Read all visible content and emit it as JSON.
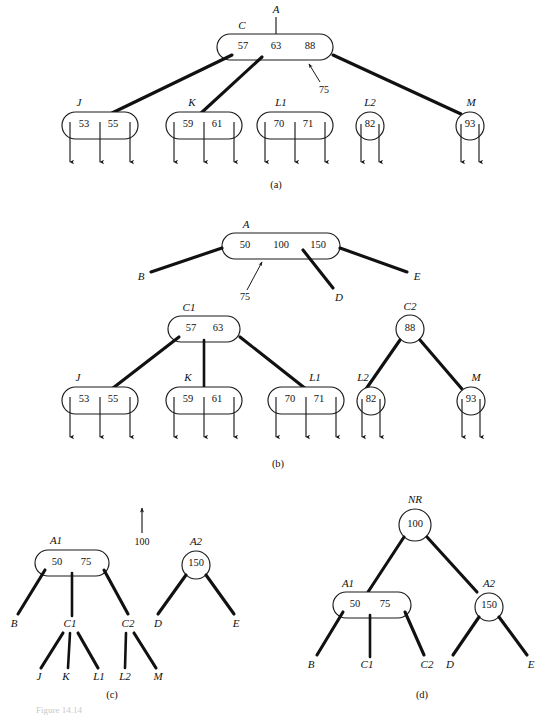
{
  "figure": {
    "caption_partial": "Figure 14.14",
    "width": 557,
    "height": 715,
    "background": "#ffffff",
    "ink_color": "#111111"
  },
  "panels": [
    {
      "id": "a",
      "caption": "(a)",
      "parent_pointer_label": "A",
      "annotation": "75",
      "nodes": [
        {
          "name": "C",
          "label": "C",
          "shape": "rounded",
          "values": [
            "57",
            "63",
            "88"
          ],
          "child_arrows": 0
        },
        {
          "name": "J",
          "label": "J",
          "shape": "rounded",
          "values": [
            "53",
            "55"
          ],
          "child_arrows": 3
        },
        {
          "name": "K",
          "label": "K",
          "shape": "rounded",
          "values": [
            "59",
            "61"
          ],
          "child_arrows": 3
        },
        {
          "name": "L1",
          "label": "L1",
          "shape": "rounded",
          "values": [
            "70",
            "71"
          ],
          "child_arrows": 3
        },
        {
          "name": "L2",
          "label": "L2",
          "shape": "circle",
          "values": [
            "82"
          ],
          "child_arrows": 2
        },
        {
          "name": "M",
          "label": "M",
          "shape": "circle",
          "values": [
            "93"
          ],
          "child_arrows": 2
        }
      ]
    },
    {
      "id": "b",
      "caption": "(b)",
      "annotation": "75",
      "nodes": [
        {
          "name": "A",
          "label": "A",
          "shape": "rounded",
          "values": [
            "50",
            "100",
            "150"
          ],
          "child_arrows": 0
        },
        {
          "name": "B",
          "label": "B",
          "shape": "leaf-label",
          "values": []
        },
        {
          "name": "D",
          "label": "D",
          "shape": "leaf-label",
          "values": []
        },
        {
          "name": "E",
          "label": "E",
          "shape": "leaf-label",
          "values": []
        },
        {
          "name": "C1",
          "label": "C1",
          "shape": "rounded",
          "values": [
            "57",
            "63"
          ],
          "child_arrows": 0
        },
        {
          "name": "C2",
          "label": "C2",
          "shape": "circle",
          "values": [
            "88"
          ],
          "child_arrows": 0
        },
        {
          "name": "J",
          "label": "J",
          "shape": "rounded",
          "values": [
            "53",
            "55"
          ],
          "child_arrows": 3
        },
        {
          "name": "K",
          "label": "K",
          "shape": "rounded",
          "values": [
            "59",
            "61"
          ],
          "child_arrows": 3
        },
        {
          "name": "L1",
          "label": "L1",
          "shape": "rounded",
          "values": [
            "70",
            "71"
          ],
          "child_arrows": 3
        },
        {
          "name": "L2",
          "label": "L2",
          "shape": "circle",
          "values": [
            "82"
          ],
          "child_arrows": 2
        },
        {
          "name": "M",
          "label": "M",
          "shape": "circle",
          "values": [
            "93"
          ],
          "child_arrows": 2
        }
      ]
    },
    {
      "id": "c",
      "caption": "(c)",
      "promoted_key": "100",
      "nodes": [
        {
          "name": "A1",
          "label": "A1",
          "shape": "rounded",
          "values": [
            "50",
            "75"
          ]
        },
        {
          "name": "A2",
          "label": "A2",
          "shape": "circle",
          "values": [
            "150"
          ]
        }
      ],
      "leaf_labels_left": [
        "B",
        "C1",
        "C2"
      ],
      "leaf_labels_c1": [
        "J",
        "K",
        "L1"
      ],
      "leaf_labels_c2": [
        "L2",
        "M"
      ],
      "leaf_labels_right": [
        "D",
        "E"
      ]
    },
    {
      "id": "d",
      "caption": "(d)",
      "nodes": [
        {
          "name": "NR",
          "label": "NR",
          "shape": "circle",
          "values": [
            "100"
          ]
        },
        {
          "name": "A1",
          "label": "A1",
          "shape": "rounded",
          "values": [
            "50",
            "75"
          ]
        },
        {
          "name": "A2",
          "label": "A2",
          "shape": "circle",
          "values": [
            "150"
          ]
        }
      ],
      "leaf_labels_left": [
        "B",
        "C1",
        "C2"
      ],
      "leaf_labels_right": [
        "D",
        "E"
      ]
    }
  ],
  "text": {
    "a_label_A": "A",
    "a_label_C": "C",
    "a_label_J": "J",
    "a_label_K": "K",
    "a_label_L1": "L1",
    "a_label_L2": "L2",
    "a_label_M": "M",
    "a_v_57": "57",
    "a_v_63": "63",
    "a_v_88": "88",
    "a_v_75": "75",
    "a_v_53": "53",
    "a_v_55": "55",
    "a_v_59": "59",
    "a_v_61": "61",
    "a_v_70": "70",
    "a_v_71": "71",
    "a_v_82": "82",
    "a_v_93": "93",
    "a_caption": "(a)",
    "b_label_A": "A",
    "b_v_50": "50",
    "b_v_100": "100",
    "b_v_150": "150",
    "b_label_B": "B",
    "b_label_D": "D",
    "b_label_E": "E",
    "b_v_75": "75",
    "b_label_C1": "C1",
    "b_label_C2": "C2",
    "b_v_57": "57",
    "b_v_63": "63",
    "b_v_88": "88",
    "b_label_J": "J",
    "b_label_K": "K",
    "b_label_L1": "L1",
    "b_label_L2": "L2",
    "b_label_M": "M",
    "b_v_53": "53",
    "b_v_55": "55",
    "b_v_59": "59",
    "b_v_61": "61",
    "b_v_70": "70",
    "b_v_71": "71",
    "b_v_82": "82",
    "b_v_93": "93",
    "b_caption": "(b)",
    "c_promote_100": "100",
    "c_label_A1": "A1",
    "c_v_50": "50",
    "c_v_75": "75",
    "c_label_A2": "A2",
    "c_v_150": "150",
    "c_label_B": "B",
    "c_label_C1": "C1",
    "c_label_C2": "C2",
    "c_label_D": "D",
    "c_label_E": "E",
    "c_label_J": "J",
    "c_label_K": "K",
    "c_label_L1": "L1",
    "c_label_L2": "L2",
    "c_label_M": "M",
    "c_caption": "(c)",
    "d_label_NR": "NR",
    "d_v_100": "100",
    "d_label_A1": "A1",
    "d_v_50": "50",
    "d_v_75": "75",
    "d_label_A2": "A2",
    "d_v_150": "150",
    "d_label_B": "B",
    "d_label_C1": "C1",
    "d_label_C2": "C2",
    "d_label_D": "D",
    "d_label_E": "E",
    "d_caption": "(d)",
    "fig_caption": "Figure 14.14"
  }
}
